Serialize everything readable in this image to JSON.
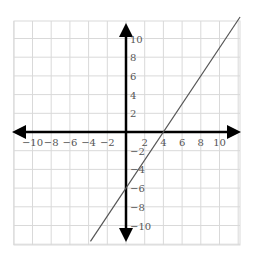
{
  "chart_data": {
    "type": "line",
    "title": "",
    "xlabel": "",
    "ylabel": "",
    "xlim": [
      -12,
      12
    ],
    "ylim": [
      -12,
      12
    ],
    "grid": true,
    "grid_step": 2,
    "x_ticks": [
      -10,
      -8,
      -6,
      -4,
      -2,
      2,
      4,
      6,
      8,
      10
    ],
    "y_ticks": [
      10,
      8,
      6,
      4,
      2,
      -2,
      -4,
      -6,
      -8,
      -10
    ],
    "x_tick_labels": [
      "−10",
      "−8",
      "−6",
      "−4",
      "−2",
      "2",
      "4",
      "6",
      "8",
      "10"
    ],
    "y_tick_labels": [
      "10",
      "8",
      "6",
      "4",
      "2",
      "−2",
      "−4",
      "−6",
      "−8",
      "−10"
    ],
    "series": [
      {
        "name": "y = 1.5x − 6",
        "slope": 1.5,
        "intercept": -6,
        "x_intercept": 4,
        "y_intercept": -6,
        "x": [
          -3.8,
          12.2
        ],
        "y": [
          -11.7,
          12.3
        ],
        "color": "#555555"
      }
    ],
    "axis_color": "#000000",
    "grid_color": "#d9d9d9"
  }
}
